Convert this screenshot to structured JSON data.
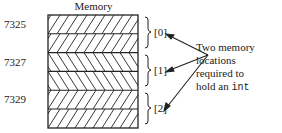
{
  "diagram": {
    "title": "Memory",
    "addresses": [
      {
        "label": "7325",
        "row": 0
      },
      {
        "label": "7327",
        "row": 2
      },
      {
        "label": "7329",
        "row": 4
      }
    ],
    "rows": [
      {
        "hatch": "forward"
      },
      {
        "hatch": "forward"
      },
      {
        "hatch": "backward"
      },
      {
        "hatch": "backward"
      },
      {
        "hatch": "forward"
      },
      {
        "hatch": "forward"
      }
    ],
    "indices": [
      "[0]",
      "[1]",
      "[2]"
    ],
    "annotation": {
      "lines": [
        "Two memory",
        "locations",
        "required to"
      ],
      "last_line_prefix": "hold an ",
      "last_line_code": "int"
    },
    "colors": {
      "line": "#222222",
      "background": "#ffffff"
    }
  }
}
